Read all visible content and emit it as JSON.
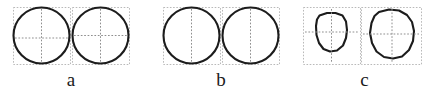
{
  "figure": {
    "background_color": "#ffffff",
    "outline_color": "#1c1c1c",
    "bbox_color": "#b9b9b9",
    "axis_color": "#8f8f8f",
    "panels": [
      {
        "key": "a",
        "label": "a",
        "left": 5,
        "width": 132,
        "shape_kind": "circle",
        "crosshair": "both",
        "items": [
          {
            "name": "panel-a-shape-left",
            "box": {
              "x": 8,
              "y": 7,
              "w": 57,
              "h": 57
            },
            "shape": {
              "type": "circle",
              "cx": 36.5,
              "cy": 35.5,
              "r": 28.0
            },
            "axes": {
              "vertical_x": 36.5,
              "horizontal_y": 38.0,
              "vertical": true,
              "horizontal": true
            }
          },
          {
            "name": "panel-a-shape-right",
            "box": {
              "x": 67,
              "y": 7,
              "w": 57,
              "h": 57
            },
            "shape": {
              "type": "circle",
              "cx": 95.5,
              "cy": 35.5,
              "r": 28.0
            },
            "axes": {
              "vertical_x": 95.5,
              "horizontal_y": 35.5,
              "vertical": true,
              "horizontal": true
            }
          }
        ]
      },
      {
        "key": "b",
        "label": "b",
        "left": 155,
        "width": 132,
        "shape_kind": "circle",
        "crosshair": "vertical",
        "items": [
          {
            "name": "panel-b-shape-left",
            "box": {
              "x": 8,
              "y": 7,
              "w": 57,
              "h": 57
            },
            "shape": {
              "type": "circle",
              "cx": 36.5,
              "cy": 35.5,
              "r": 28.0
            },
            "axes": {
              "vertical_x": 36.5,
              "horizontal_y": 35.5,
              "vertical": true,
              "horizontal": false
            }
          },
          {
            "name": "panel-b-shape-right",
            "box": {
              "x": 67,
              "y": 7,
              "w": 57,
              "h": 57
            },
            "shape": {
              "type": "circle",
              "cx": 95.5,
              "cy": 35.5,
              "r": 28.0
            },
            "axes": {
              "vertical_x": 95.5,
              "horizontal_y": 35.5,
              "vertical": true,
              "horizontal": false
            }
          }
        ]
      },
      {
        "key": "c",
        "label": "c",
        "left": 297,
        "width": 135,
        "shape_kind": "blob",
        "crosshair": "both",
        "items": [
          {
            "name": "panel-c-shape-left",
            "box": {
              "x": 6,
              "y": 7,
              "w": 57,
              "h": 57
            },
            "shape": {
              "type": "polygon",
              "points": "22.5,15.5 30.0,13.0 38.5,13.0 45.5,15.5 49.0,21.5 50.0,30.0 49.0,38.0 46.0,45.5 40.0,50.5 33.0,51.5 26.5,49.0 22.0,43.0 19.5,35.0 19.0,26.0 20.0,19.5"
            },
            "axes": {
              "vertical_x": 34.5,
              "horizontal_y": 32.0,
              "vertical": true,
              "horizontal": true
            }
          },
          {
            "name": "panel-c-shape-right",
            "box": {
              "x": 64,
              "y": 7,
              "w": 60,
              "h": 57
            },
            "shape": {
              "type": "polygon",
              "points": "82.0,12.0 92.0,9.5 102.0,10.5 110.0,15.0 115.0,22.0 117.0,31.0 116.0,41.0 112.0,50.0 105.0,56.5 96.0,58.5 87.0,57.0 79.5,51.5 75.0,43.0 73.0,33.0 74.5,23.0 77.5,16.0"
            },
            "axes": {
              "vertical_x": 95.0,
              "horizontal_y": 34.0,
              "vertical": true,
              "horizontal": true
            }
          }
        ]
      }
    ]
  }
}
